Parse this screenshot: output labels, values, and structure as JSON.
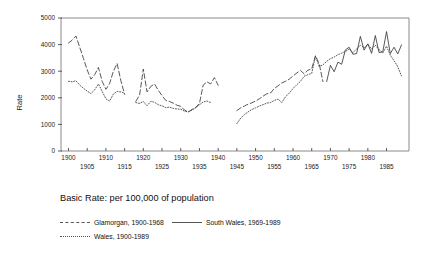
{
  "chart_data": {
    "type": "line",
    "title": "",
    "xlabel": "",
    "ylabel": "Rate",
    "xlim": [
      1898,
      1991
    ],
    "ylim": [
      0,
      5000
    ],
    "grid": false,
    "legend_position": "below-plot",
    "caption": "Basic Rate: per 100,000 of population",
    "y_ticks": [
      0,
      1000,
      2000,
      3000,
      4000,
      5000
    ],
    "y_tick_labels": [
      "0",
      "1000",
      "2000",
      "3000",
      "4000",
      "5000"
    ],
    "x_ticks": [
      1900,
      1905,
      1910,
      1915,
      1920,
      1925,
      1930,
      1935,
      1940,
      1945,
      1950,
      1955,
      1960,
      1965,
      1970,
      1975,
      1980,
      1985
    ],
    "x_tick_labels_upper": [
      "1900",
      "1910",
      "1920",
      "1930",
      "1940",
      "1950",
      "1960",
      "1970",
      "1980"
    ],
    "x_tick_labels_lower": [
      "1905",
      "1915",
      "1925",
      "1935",
      "1945",
      "1955",
      "1965",
      "1975",
      "1985"
    ],
    "series": [
      {
        "name": "Glamorgan, 1900-1968",
        "style": "dashed",
        "color": "#3a3a3a",
        "x": [
          1900,
          1901,
          1902,
          1903,
          1904,
          1905,
          1906,
          1907,
          1908,
          1909,
          1910,
          1911,
          1912,
          1913,
          1914,
          1915,
          1918,
          1919,
          1920,
          1921,
          1922,
          1923,
          1924,
          1925,
          1926,
          1927,
          1928,
          1929,
          1930,
          1931,
          1932,
          1933,
          1934,
          1935,
          1936,
          1937,
          1938,
          1939,
          1940,
          1945,
          1946,
          1947,
          1948,
          1949,
          1950,
          1951,
          1952,
          1953,
          1954,
          1955,
          1956,
          1957,
          1958,
          1959,
          1960,
          1961,
          1962,
          1963,
          1964,
          1965,
          1966,
          1967,
          1968
        ],
        "values": [
          4060,
          4170,
          4320,
          3900,
          3480,
          3050,
          2700,
          2870,
          3140,
          2620,
          2320,
          2540,
          3000,
          3290,
          2640,
          2130,
          1870,
          2100,
          3080,
          2220,
          2430,
          2520,
          2280,
          2080,
          1900,
          1860,
          1800,
          1720,
          1680,
          1540,
          1470,
          1560,
          1640,
          1790,
          2480,
          2600,
          2520,
          2760,
          2470,
          1520,
          1620,
          1690,
          1760,
          1810,
          1880,
          1960,
          2060,
          2150,
          2180,
          2350,
          2450,
          2560,
          2620,
          2700,
          2820,
          2930,
          3030,
          2900,
          3040,
          3090,
          3580,
          3280,
          2610
        ]
      },
      {
        "name": "South Wales, 1969-1989",
        "style": "solid",
        "color": "#3a3a3a",
        "x": [
          1969,
          1970,
          1971,
          1972,
          1973,
          1974,
          1975,
          1976,
          1977,
          1978,
          1979,
          1980,
          1981,
          1982,
          1983,
          1984,
          1985,
          1986,
          1987,
          1988,
          1989
        ],
        "values": [
          2610,
          3220,
          2980,
          3340,
          3260,
          3800,
          3900,
          3640,
          3660,
          4310,
          3790,
          4030,
          3670,
          4340,
          3700,
          3730,
          4490,
          3660,
          3900,
          3650,
          3990
        ]
      },
      {
        "name": "Wales, 1900-1989",
        "style": "dotted",
        "color": "#5a5a5a",
        "x": [
          1900,
          1901,
          1902,
          1903,
          1904,
          1905,
          1906,
          1907,
          1908,
          1909,
          1910,
          1911,
          1912,
          1913,
          1914,
          1915,
          1918,
          1919,
          1920,
          1921,
          1922,
          1923,
          1924,
          1925,
          1926,
          1927,
          1928,
          1929,
          1930,
          1931,
          1932,
          1933,
          1934,
          1935,
          1936,
          1937,
          1938,
          1945,
          1946,
          1947,
          1948,
          1949,
          1950,
          1951,
          1952,
          1953,
          1954,
          1955,
          1956,
          1957,
          1958,
          1959,
          1960,
          1961,
          1962,
          1963,
          1964,
          1965,
          1966,
          1967,
          1968,
          1969,
          1970,
          1971,
          1972,
          1973,
          1974,
          1975,
          1976,
          1977,
          1978,
          1979,
          1980,
          1981,
          1982,
          1983,
          1984,
          1985,
          1986,
          1987,
          1988,
          1989
        ],
        "values": [
          2620,
          2600,
          2640,
          2480,
          2360,
          2250,
          2160,
          2300,
          2520,
          2240,
          1960,
          1880,
          2140,
          2240,
          2220,
          2180,
          1820,
          1790,
          1860,
          1700,
          1870,
          1830,
          1740,
          1700,
          1630,
          1650,
          1600,
          1580,
          1570,
          1500,
          1470,
          1540,
          1620,
          1740,
          1840,
          1880,
          1820,
          1030,
          1230,
          1370,
          1470,
          1560,
          1620,
          1690,
          1740,
          1800,
          1820,
          1900,
          1950,
          1820,
          2040,
          2180,
          2350,
          2490,
          2620,
          2810,
          2870,
          2920,
          3560,
          3180,
          3240,
          3370,
          3470,
          3530,
          3620,
          3680,
          3740,
          3830,
          3700,
          3830,
          3980,
          3880,
          4010,
          3830,
          3980,
          3810,
          3690,
          3940,
          3600,
          3400,
          3170,
          2820
        ]
      }
    ]
  },
  "legend": {
    "rows": [
      [
        {
          "label": "Glamorgan, 1900-1968",
          "style": "dashed"
        },
        {
          "label": "South Wales, 1969-1989",
          "style": "solid"
        }
      ],
      [
        {
          "label": "Wales, 1900-1989",
          "style": "dotted"
        }
      ]
    ]
  }
}
